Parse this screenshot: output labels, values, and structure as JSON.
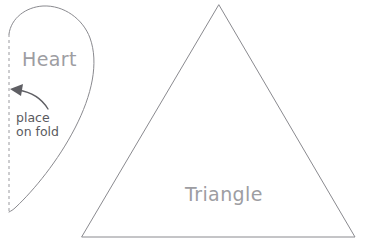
{
  "document": {
    "type": "sewing-pattern-template",
    "background_color": "#ffffff",
    "width": 370,
    "height": 247
  },
  "style": {
    "outline_color": "#8a8a8f",
    "fold_line_color": "#9a9a9f",
    "arrow_color": "#5f5f64",
    "major_label_color": "#9d9da2",
    "note_label_color": "#5a5a60"
  },
  "shapes": {
    "heart": {
      "label": "Heart",
      "label_x": 22,
      "label_y": 66,
      "note_line_1": "place",
      "note_line_2": "on fold",
      "note_x": 16,
      "note_y": 122,
      "fold_line": {
        "x": 9,
        "y_top": 34,
        "y_bottom": 212
      },
      "outline_path": "M 9 34 C 11 18 26 7 43 6 C 64 5 83 19 90 38 C 99 63 92 95 75 128 C 58 161 34 190 16 207 C 13 210 11 211 9 212",
      "arrow": {
        "path": "M 48 109 C 42 99 31 92 18 90",
        "head_points": "10 89 23 84 21 96"
      }
    },
    "triangle": {
      "label": "Triangle",
      "label_x": 185,
      "label_y": 201,
      "apex_x": 219,
      "apex_y": 5,
      "bottom_left_x": 82,
      "bottom_left_y": 237,
      "bottom_right_x": 355,
      "bottom_right_y": 237,
      "outline_path": "M 219 5 L 355 237 L 82 237 Z"
    }
  }
}
